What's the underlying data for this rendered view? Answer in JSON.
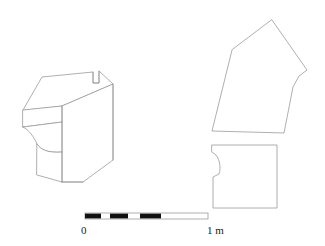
{
  "figure": {
    "background_color": "#ffffff",
    "line_color": "#9a9a9a",
    "objects": [
      {
        "id": "isometric-block",
        "name": "isometric-view-of-moulded-block",
        "description": "Axonometric line drawing of a cornice / moulded stone block with a rebate notch on the top face and an ogee moulding on the front face",
        "top_face_path": "M 23,110 L 42,77 L 93,72 L 93,83 L 99,83 L 99,71 L 113,84 L 62,106 Z",
        "front_upper_band_path": "M 23,110 L 62,106 L 62,122 L 23,127 Z",
        "ogee_front_path": "M 23,127 C 29,130 34,137 37,144 C 41,150 48,153 62,152 L 62,122 L 23,127 Z",
        "plinth_front_path": "M 37,144 C 41,150 48,153 62,152 L 62,182 L 37,175 Z",
        "right_side_path": "M 62,106 L 113,84 L 113,160 L 83,182 L 62,182 Z",
        "edges": [
          "M 62,106 L 62,122",
          "M 62,122 L 62,152",
          "M 62,152 L 62,182",
          "M 93,72 L 93,83 L 99,83 L 99,71",
          "M 113,84 L 113,160",
          "M 62,182 L 83,182"
        ]
      },
      {
        "id": "plan-polygon",
        "name": "plan-view-polygon",
        "description": "Irregular six-sided plan outline of the block",
        "path": "M 272,20 L 307,70 L 299,76 L 293,87 L 284,133 L 212,131 L 232,50 Z"
      },
      {
        "id": "section-profile",
        "name": "section-profile-outline",
        "description": "Section / profile outline of the block showing the ogee moulding cut on the left edge",
        "path": "M 212,145 L 277,145 L 277,208 L 213,208 L 213,177 L 219,174 C 221,168 220,160 216,155 L 212,152 Z"
      }
    ]
  },
  "scale_bar": {
    "name": "scale-bar",
    "unit": "m",
    "start_label": "0",
    "end_label": "1 m",
    "total_length_px": 123,
    "x_start": 85,
    "x_end": 208,
    "y": 213,
    "height": 6,
    "segment_count": 10,
    "dark_segments": [
      {
        "x": 85,
        "width": 16
      },
      {
        "x": 110,
        "width": 18
      },
      {
        "x": 140,
        "width": 21
      }
    ],
    "frame_color": "#8d8d8d",
    "dark_color": "#111111"
  }
}
